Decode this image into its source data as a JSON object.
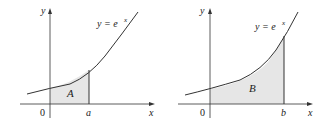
{
  "figures": [
    {
      "id": "left",
      "y_axis_label": "y",
      "x_axis_label": "x",
      "origin_label": "0",
      "curve_label": "y = e",
      "curve_exponent": "x",
      "region_label": "A",
      "bound_label": "a"
    },
    {
      "id": "right",
      "y_axis_label": "y",
      "x_axis_label": "x",
      "origin_label": "0",
      "curve_label": "y = e",
      "curve_exponent": "x",
      "region_label": "B",
      "bound_label": "b"
    }
  ],
  "colors": {
    "fill": "#e6e6e6",
    "stroke": "#333333"
  }
}
